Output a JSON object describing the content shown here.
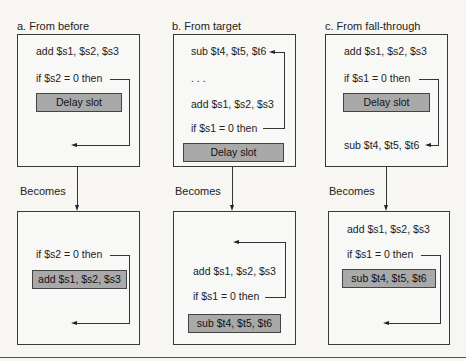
{
  "panels": [
    {
      "title": "a.  From before",
      "before": {
        "lines": [
          "add $s1, $s2, $s3",
          "if $s2 = 0 then"
        ],
        "slot": "Delay slot"
      },
      "connector": "Becomes",
      "after": {
        "lines": [
          "if $s2 = 0 then"
        ],
        "slot": "add $s1, $s2, $s3"
      }
    },
    {
      "title": "b.  From target",
      "before": {
        "lines": [
          "sub $t4, $t5, $t6",
          ". . .",
          "add $s1, $s2, $s3",
          "if $s1 = 0 then"
        ],
        "slot": "Delay slot"
      },
      "connector": "Becomes",
      "after": {
        "lines": [
          "add $s1, $s2, $s3",
          "if $s1 = 0 then"
        ],
        "slot": "sub $t4, $t5, $t6"
      }
    },
    {
      "title": "c.  From fall-through",
      "before": {
        "lines": [
          "add $s1, $s2, $s3",
          "if $s1 = 0 then",
          "sub $t4, $t5, $t6"
        ],
        "slot": "Delay slot"
      },
      "connector": "Becomes",
      "after": {
        "lines": [
          "add $s1, $s2, $s3",
          "if $s1 = 0 then"
        ],
        "slot": "sub $t4, $t5, $t6"
      }
    }
  ],
  "colors": {
    "slot_fill": "#a9a9a9",
    "border": "#3a3a3a",
    "background": "#f7f6f3"
  }
}
